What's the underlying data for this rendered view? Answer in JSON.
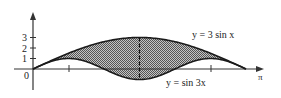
{
  "chart_data": {
    "type": "area",
    "title": "",
    "xlabel": "",
    "ylabel": "",
    "xlim": [
      0,
      3.14159
    ],
    "ylim": [
      -1,
      3
    ],
    "grid": false,
    "series": [
      {
        "name": "y = 3 sin x",
        "function": "3*sin(x)",
        "domain": [
          0,
          3.14159
        ]
      },
      {
        "name": "y = sin 3x",
        "function": "sin(3*x)",
        "domain": [
          0,
          3.14159
        ]
      }
    ],
    "shaded_region": "between y = 3 sin x and y = sin 3x over [0, π]",
    "x_ticks": [
      {
        "value": 0.5236,
        "label": ""
      },
      {
        "value": 2.618,
        "label": ""
      }
    ],
    "x_tick_labels": {
      "origin": "0",
      "end": "π"
    },
    "y_ticks": [
      {
        "value": 1,
        "label": "1"
      },
      {
        "value": 2,
        "label": "2"
      },
      {
        "value": 3,
        "label": "3"
      }
    ],
    "annotations": [
      {
        "text": "y = 3 sin x",
        "near": "upper right of curve 3 sin x"
      },
      {
        "text": "y = sin 3x",
        "near": "below x-axis, right of center"
      },
      {
        "text": "dashed vertical line",
        "x": 1.5708
      }
    ]
  },
  "labels": {
    "origin": "0",
    "pi": "π",
    "y1": "1",
    "y2": "2",
    "y3": "3",
    "curve_top": "y = 3 sin x",
    "curve_bottom": "y = sin 3x"
  },
  "colors": {
    "curve": "#1a1a1a",
    "axis": "#333333",
    "hatch_a": "#555555",
    "hatch_b": "#bdbdbd"
  }
}
